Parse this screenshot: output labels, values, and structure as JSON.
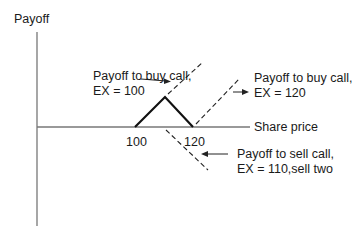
{
  "y_axis_label": "Payoff",
  "x_axis_label": "Share price",
  "tick_labels": [
    "100",
    "120"
  ],
  "annotations": {
    "buy_call_100": {
      "line1": "Payoff to buy call,",
      "line2": "EX = 100"
    },
    "buy_call_120": {
      "line1": "Payoff to buy call,",
      "line2": "EX = 120"
    },
    "sell_call_110": {
      "line1": "Payoff to sell call,",
      "line2": "EX = 110,sell two"
    }
  },
  "colors": {
    "axis": "#777777",
    "payoff": "#111111",
    "dashed": "#222222"
  }
}
